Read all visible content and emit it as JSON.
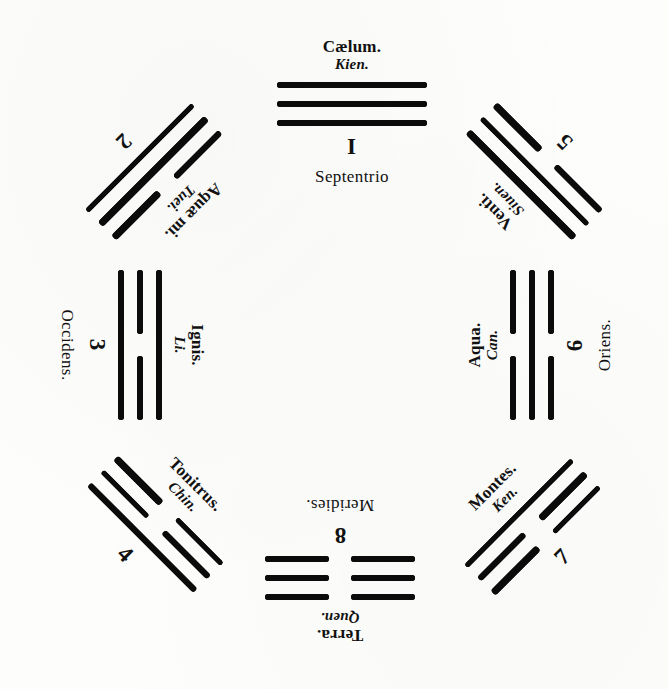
{
  "plate": {
    "title": "",
    "ink_color": "#0b0b0b",
    "paper_color": "#fdfdfb",
    "arrangement": "octagonal"
  },
  "diagram_data": {
    "type": "diagram",
    "description": "Eight trigrams arranged octagonally, each labelled with a Latin element name, a romanized Chinese name, a Roman/Arabic numeral, and (on the four axes) a Latin cardinal direction.",
    "trigrams": [
      {
        "position": "top",
        "numeral": "I",
        "latin": "Cælum.",
        "roman_name": "Kien.",
        "cardinal": "Septentrio",
        "lines": [
          "solid",
          "solid",
          "solid"
        ],
        "rotation_deg": 0,
        "x": 352,
        "y": 112
      },
      {
        "position": "top-left",
        "numeral": "2",
        "latin": "Aquæ mi.",
        "roman_name": "Tuei.",
        "cardinal": "",
        "lines": [
          "broken",
          "solid",
          "solid"
        ],
        "rotation_deg": 135,
        "x": 158,
        "y": 176
      },
      {
        "position": "top-right",
        "numeral": "5",
        "latin": "Venti.",
        "roman_name": "Siuen.",
        "cardinal": "",
        "lines": [
          "solid",
          "solid",
          "broken"
        ],
        "rotation_deg": -135,
        "x": 530,
        "y": 176
      },
      {
        "position": "left",
        "numeral": "3",
        "latin": "Ignis.",
        "roman_name": "Li.",
        "cardinal": "Occidens.",
        "lines": [
          "solid",
          "broken",
          "solid"
        ],
        "rotation_deg": 90,
        "x": 132,
        "y": 345
      },
      {
        "position": "right",
        "numeral": "6",
        "latin": "Aqua.",
        "roman_name": "Can.",
        "cardinal": "Oriens.",
        "lines": [
          "broken",
          "solid",
          "broken"
        ],
        "rotation_deg": -90,
        "x": 540,
        "y": 345
      },
      {
        "position": "bottom-left",
        "numeral": "4",
        "latin": "Tonitrus.",
        "roman_name": "Chin.",
        "cardinal": "",
        "lines": [
          "broken",
          "broken",
          "solid"
        ],
        "rotation_deg": 45,
        "x": 160,
        "y": 520
      },
      {
        "position": "bottom-right",
        "numeral": "7",
        "latin": "Montes.",
        "roman_name": "Ken.",
        "cardinal": "",
        "lines": [
          "solid",
          "broken",
          "broken"
        ],
        "rotation_deg": -45,
        "x": 528,
        "y": 522
      },
      {
        "position": "bottom",
        "numeral": "8",
        "latin": "Terra.",
        "roman_name": "Quen.",
        "cardinal": "Meridies.",
        "lines": [
          "broken",
          "broken",
          "broken"
        ],
        "rotation_deg": 180,
        "x": 340,
        "y": 570
      }
    ]
  }
}
